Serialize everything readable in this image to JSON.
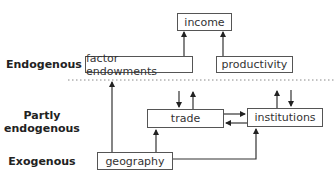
{
  "row_labels": {
    "endogenous": "Endogenous",
    "partly_line1": "Partly",
    "partly_line2": "endogenous",
    "exogenous": "Exogenous"
  },
  "nodes": {
    "income": "income",
    "factor_endowments": "factor endowments",
    "productivity": "productivity",
    "trade": "trade",
    "institutions": "institutions",
    "geography": "geography"
  },
  "edges": [
    {
      "from": "factor endowments",
      "to": "income"
    },
    {
      "from": "productivity",
      "to": "income"
    },
    {
      "from": "geography",
      "to": "factor endowments (across divider)"
    },
    {
      "from": "geography",
      "to": "trade"
    },
    {
      "from": "geography",
      "to": "institutions"
    },
    {
      "from": "trade",
      "to": "institutions"
    },
    {
      "from": "institutions",
      "to": "trade"
    },
    {
      "from": "trade",
      "to": "endogenous layer (up)"
    },
    {
      "from": "endogenous layer",
      "to": "trade (down)"
    },
    {
      "from": "institutions",
      "to": "endogenous layer (up)"
    },
    {
      "from": "endogenous layer",
      "to": "institutions (down)"
    }
  ],
  "colors": {
    "line": "#333333",
    "box_border": "#555555",
    "divider": "#888888"
  }
}
